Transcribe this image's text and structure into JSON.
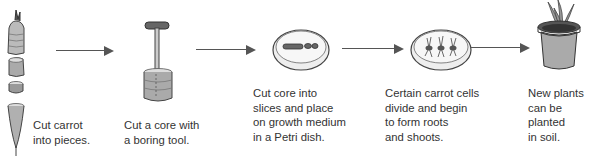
{
  "diagram": {
    "steps": [
      {
        "id": "step1",
        "illustration": "carrot-pieces",
        "caption_lines": [
          "Cut carrot",
          "into pieces."
        ]
      },
      {
        "id": "step2",
        "illustration": "boring-tool-core",
        "caption_lines": [
          "Cut a core with",
          "a boring tool."
        ]
      },
      {
        "id": "step3",
        "illustration": "petri-dish-slices",
        "caption_lines": [
          "Cut core into",
          "slices and place",
          "on growth medium",
          "in a Petri dish."
        ]
      },
      {
        "id": "step4",
        "illustration": "petri-dish-sprouts",
        "caption_lines": [
          "Certain carrot cells",
          "divide and begin",
          "to form roots",
          "and shoots."
        ]
      },
      {
        "id": "step5",
        "illustration": "potted-plant",
        "caption_lines": [
          "New plants",
          "can be",
          "planted",
          "in soil."
        ]
      }
    ],
    "arrows": 4,
    "colors": {
      "line": "#555555",
      "text": "#333333",
      "background": "#ffffff"
    }
  }
}
